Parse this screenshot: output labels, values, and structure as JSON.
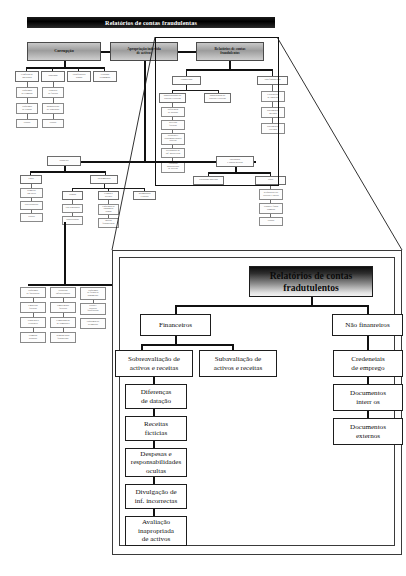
{
  "title_bar": {
    "label": "Relatórios de contas fraudulentas"
  },
  "overview": {
    "level1": [
      {
        "label": "Corrupção"
      },
      {
        "label": "Apropriação indevida\nde activos"
      },
      {
        "label": "Relatórios de contas\nfraudulentos"
      }
    ],
    "corruption_children": [
      {
        "label": "Conflitos de\ninteresses"
      },
      {
        "label": "Subornos"
      },
      {
        "label": "Gratificações\nilegais"
      },
      {
        "label": "Extorsão\neconómica"
      }
    ],
    "corruption_col1": [
      {
        "label": "Esquemas\nde compras"
      },
      {
        "label": "Esquemas\nde vendas"
      },
      {
        "label": "Outros"
      }
    ],
    "corruption_col2": [
      {
        "label": "Convites\nde factura"
      },
      {
        "label": "Manipulação\nde concursos"
      },
      {
        "label": "Outros"
      }
    ],
    "fraud_children": [
      {
        "label": "Financeiros"
      },
      {
        "label": "Não financeiros"
      }
    ],
    "fin_children": [
      {
        "label": "Sobreavaliação de\nactivos e receitas"
      },
      {
        "label": "Subavaliação de\nactivos e receitas"
      }
    ],
    "fin_chain": [
      {
        "label": "Diferenças\nde datação"
      },
      {
        "label": "Receitas\nfictícias"
      },
      {
        "label": "Despesas e\nresponsabilidades\nocultas"
      },
      {
        "label": "Divulgação de\ninf. incorrectas"
      },
      {
        "label": "Avaliação\ninapropriada\nde activos"
      }
    ],
    "nonfin_chain": [
      {
        "label": "Credenciais\nde emprego"
      },
      {
        "label": "Documentos\ninternos"
      },
      {
        "label": "Documentos\nexternos"
      }
    ],
    "misappropriation": {
      "cash": {
        "label": "Dinheiro"
      },
      "inventory": {
        "label": "Inventário\ne outros activos"
      },
      "cash_children": [
        {
          "label": "Furto"
        },
        {
          "label": "Desembolsos"
        }
      ],
      "theft_chain": [
        {
          "label": "Dinheiro\nem caixa"
        },
        {
          "label": "Dos depósitos"
        },
        {
          "label": "Outros"
        }
      ],
      "disb_children": [
        {
          "label": "Vendas"
        },
        {
          "label": "Contas a\nreceber"
        },
        {
          "label": "Reembolsos\ne outros"
        }
      ],
      "disb_sub1": [
        {
          "label": "Não registadas"
        },
        {
          "label": "Subavaliadas"
        }
      ],
      "disb_sub2": [
        {
          "label": "Esquemas de\nlapping de\ncontas"
        },
        {
          "label": "Baixas\nfraudulentas"
        }
      ],
      "disb_bottom": [
        {
          "label": "Esquemas\nde facturação"
        },
        {
          "label": "Despesas\ninflaccionadas"
        },
        {
          "label": "Esquemas\nde folhas de\npagamento"
        }
      ],
      "disb_bottom2": [
        {
          "label": "Empresas\nfictícias"
        },
        {
          "label": "Empregados\nfictícios"
        },
        {
          "label": "Horas e\nsalários\nfalsificados"
        }
      ],
      "disb_bottom3": [
        {
          "label": "Vendedores\nexistentes"
        },
        {
          "label": "Compensação\nde comissões"
        },
        {
          "label": "Esquemas de\nreembolso"
        }
      ],
      "disb_bottom4": [
        {
          "label": "Compras\npessoais"
        },
        {
          "label": "Remuneração\nfraudulenta"
        }
      ],
      "inv_children": [
        {
          "label": "Utilização indevida"
        },
        {
          "label": "Furto"
        }
      ],
      "inv_chain": [
        {
          "label": "Requisições de\nactivos e envios"
        },
        {
          "label": "Vendas e falsas\ncompras"
        },
        {
          "label": "Outros"
        }
      ]
    }
  },
  "callout": {
    "title": "Relatórios de contas\nfradutulentos",
    "branches": [
      {
        "label": "Financeiros"
      },
      {
        "label": "Não finanreiros"
      }
    ],
    "financial_children": [
      {
        "label": "Sobreavaliação de\nactivos e receitas"
      },
      {
        "label": "Subavaliação de\nactivos e receitas"
      }
    ],
    "financial_chain": [
      {
        "label": "Diferenças\nde datação"
      },
      {
        "label": "Receitas\nfictícias"
      },
      {
        "label": "Despesas e\nresponsabilidades\nocultas"
      },
      {
        "label": "Divulgação de\ninf. incorrectas"
      },
      {
        "label": "Avaliação\ninapropriada\nde activos"
      }
    ],
    "nonfinancial_chain": [
      {
        "label": "Credeneiais\nde emprego"
      },
      {
        "label": "Documentos\ninterr os"
      },
      {
        "label": "Documentos\nexternos"
      }
    ]
  },
  "colors": {
    "title_bar_bg": "#000000",
    "title_bar_text": "#ffffff",
    "box_border": "#1d1d1d",
    "box_bg": "#ffffff",
    "gradient_dark": "#0d0d0d",
    "gradient_light": "#f4f4f4"
  }
}
